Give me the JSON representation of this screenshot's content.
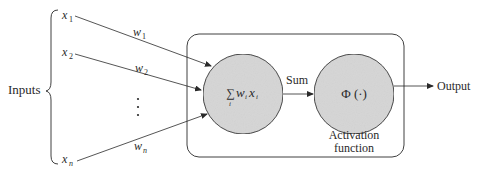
{
  "inputs_label": "Inputs",
  "inputs": [
    {
      "name": "x",
      "sub": "1"
    },
    {
      "name": "x",
      "sub": "2"
    },
    {
      "name": "x",
      "sub": "n"
    }
  ],
  "weights": [
    {
      "name": "w",
      "sub": "1"
    },
    {
      "name": "w",
      "sub": "2"
    },
    {
      "name": "w",
      "sub": "n"
    }
  ],
  "ellipsis": "⋮",
  "summation_node": {
    "sigma": "∑",
    "sigma_index": "i",
    "term_w": "w",
    "term_w_sub": "i",
    "term_x": "x",
    "term_x_sub": "i"
  },
  "sum_label": "Sum",
  "activation_node": {
    "symbol": "Φ (·)",
    "label_line1": "Activation",
    "label_line2": "function"
  },
  "output_label": "Output",
  "colors": {
    "node_fill": "#d6d6d6",
    "stroke": "#2a2a2a",
    "text": "#2a2a2a"
  }
}
